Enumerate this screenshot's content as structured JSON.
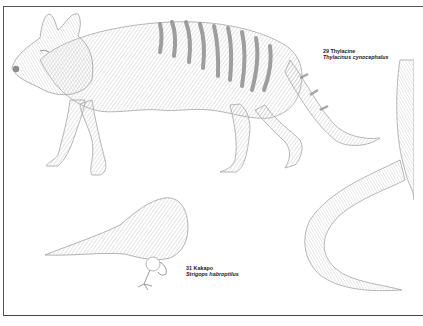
{
  "plate": {
    "labels": [
      {
        "number": "29",
        "common_name": "Thylacine",
        "scientific_name": "Thylacinus cynocephalus",
        "common_line": "29 Thylacine"
      },
      {
        "number": "31",
        "common_name": "Kakapo",
        "scientific_name": "Strigops habroptilus",
        "common_line": "31 Kakapo"
      }
    ],
    "animals": [
      "thylacine",
      "kakapo",
      "unlabeled-tail-animal"
    ],
    "colors": {
      "ink": "#9a9a9a",
      "stripe": "#8c8c8c",
      "frame": "#555555",
      "text": "#222222"
    }
  }
}
